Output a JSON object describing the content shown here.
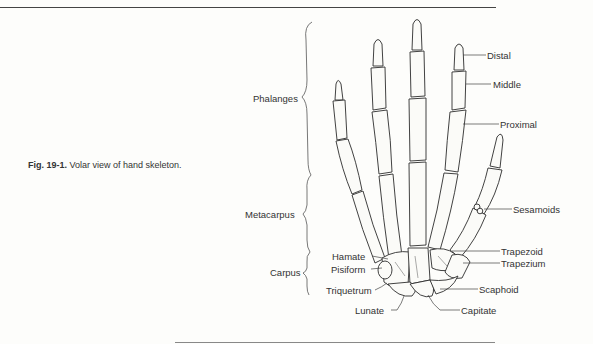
{
  "figure": {
    "number_label": "Fig. 19-1.",
    "caption_text": " Volar view of hand skeleton."
  },
  "regions": [
    {
      "id": "phalanges",
      "label": "Phalanges"
    },
    {
      "id": "metacarpus",
      "label": "Metacarpus"
    },
    {
      "id": "carpus",
      "label": "Carpus"
    }
  ],
  "phalanx_labels": [
    {
      "id": "distal",
      "label": "Distal"
    },
    {
      "id": "middle",
      "label": "Middle"
    },
    {
      "id": "proximal",
      "label": "Proximal"
    }
  ],
  "right_labels": [
    {
      "id": "sesamoids",
      "label": "Sesamoids"
    },
    {
      "id": "trapezoid",
      "label": "Trapezoid"
    },
    {
      "id": "trapezium",
      "label": "Trapezium"
    },
    {
      "id": "scaphoid",
      "label": "Scaphoid"
    },
    {
      "id": "capitate",
      "label": "Capitate"
    }
  ],
  "left_carpal_labels": [
    {
      "id": "hamate",
      "label": "Hamate"
    },
    {
      "id": "pisiform",
      "label": "Pisiform"
    },
    {
      "id": "triquetrum",
      "label": "Triquetrum"
    },
    {
      "id": "lunate",
      "label": "Lunate"
    }
  ],
  "colors": {
    "background": "#fdfdfb",
    "ink": "#2d2d2d",
    "rule": "#444444"
  }
}
